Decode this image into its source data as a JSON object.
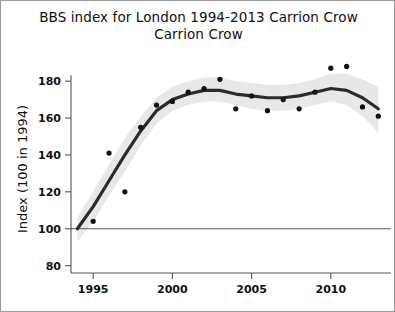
{
  "figure": {
    "title_lines": [
      "BBS index for London 1994-2013",
      "Carrion Crow"
    ],
    "frame_color": "#9a9a9a",
    "background_color": "#ffffff"
  },
  "chart_data": {
    "type": "line",
    "title": "BBS index for London 1994-2013 Carrion Crow",
    "subtitle": "Carrion Crow",
    "xlabel": "",
    "ylabel": "Index (100 in 1994)",
    "xlim": [
      1993.6,
      2013.8
    ],
    "ylim": [
      76,
      192
    ],
    "grid": false,
    "legend": "none",
    "x_ticks": [
      1995,
      2000,
      2005,
      2010
    ],
    "x_tick_labels": [
      "1995",
      "2000",
      "2005",
      "2010"
    ],
    "y_ticks": [
      80,
      100,
      120,
      140,
      160,
      180
    ],
    "y_tick_labels": [
      "80",
      "100",
      "120",
      "140",
      "160",
      "180"
    ],
    "reference_line": {
      "value": 100,
      "color": "#5a5a5a"
    },
    "x": [
      1994,
      1995,
      1996,
      1997,
      1998,
      1999,
      2000,
      2001,
      2002,
      2003,
      2004,
      2005,
      2006,
      2007,
      2008,
      2009,
      2010,
      2011,
      2012,
      2013
    ],
    "series": [
      {
        "name": "Annual index",
        "type": "scatter",
        "color": "#111111",
        "values": [
          100,
          104,
          141,
          120,
          155,
          167,
          169,
          174,
          176,
          181,
          165,
          172,
          164,
          170,
          165,
          174,
          187,
          188,
          166,
          161
        ]
      },
      {
        "name": "Smoothed trend",
        "type": "line",
        "color": "#2b2b2b",
        "values": [
          100,
          112,
          126,
          140,
          153,
          164,
          170,
          173,
          175,
          175,
          173,
          172,
          171,
          171,
          172,
          174,
          176,
          175,
          171,
          165
        ]
      },
      {
        "name": "Confidence band upper",
        "type": "band-upper",
        "color": "#e8e8e8",
        "values": [
          106,
          120,
          135,
          149,
          161,
          171,
          177,
          180,
          182,
          182,
          180,
          179,
          178,
          178,
          179,
          181,
          184,
          184,
          181,
          177
        ]
      },
      {
        "name": "Confidence band lower",
        "type": "band-lower",
        "color": "#e8e8e8",
        "values": [
          93,
          104,
          118,
          131,
          145,
          157,
          164,
          167,
          169,
          169,
          167,
          165,
          164,
          164,
          165,
          167,
          169,
          167,
          161,
          152
        ]
      }
    ]
  },
  "axes": {
    "y_axis_title": "Index (100 in 1994)"
  }
}
